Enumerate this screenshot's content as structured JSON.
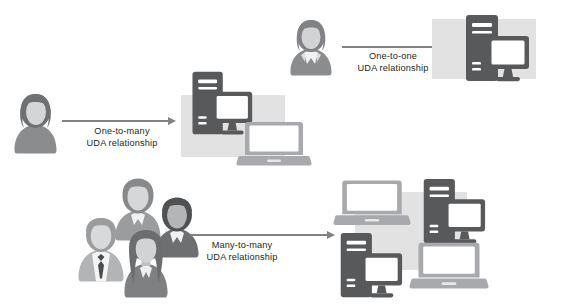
{
  "diagram": {
    "background_color": "#ffffff",
    "panel_color": "#e2e2e2",
    "arrow_color": "#808285",
    "text_color": "#231f20",
    "device_dark_color": "#58595b",
    "device_light_color": "#a7a9ac",
    "person_dark_color": "#808285",
    "person_light_color": "#bcbec0"
  },
  "relationships": [
    {
      "id": "one-to-one",
      "label_line1": "One-to-one",
      "label_line2": "UDA relationship",
      "actors": [
        {
          "name": "person-woman-suit",
          "variant": "collar"
        }
      ],
      "devices": [
        {
          "name": "desktop-tower-monitor",
          "tone": "dark"
        }
      ]
    },
    {
      "id": "one-to-many",
      "label_line1": "One-to-many",
      "label_line2": "UDA relationship",
      "actors": [
        {
          "name": "person-woman",
          "variant": "plain"
        }
      ],
      "devices": [
        {
          "name": "desktop-tower-monitor",
          "tone": "dark"
        },
        {
          "name": "laptop",
          "tone": "light"
        }
      ]
    },
    {
      "id": "many-to-many",
      "label_line1": "Many-to-many",
      "label_line2": "UDA relationship",
      "actors": [
        {
          "name": "person-man-tie",
          "variant": "tie"
        },
        {
          "name": "person-light",
          "variant": "plain"
        },
        {
          "name": "person-dark",
          "variant": "collar"
        },
        {
          "name": "person-longhair",
          "variant": "longhair"
        }
      ],
      "devices": [
        {
          "name": "laptop",
          "tone": "light"
        },
        {
          "name": "desktop-tower-monitor",
          "tone": "dark"
        },
        {
          "name": "desktop-tower-monitor",
          "tone": "dark"
        },
        {
          "name": "laptop",
          "tone": "light"
        }
      ]
    }
  ]
}
